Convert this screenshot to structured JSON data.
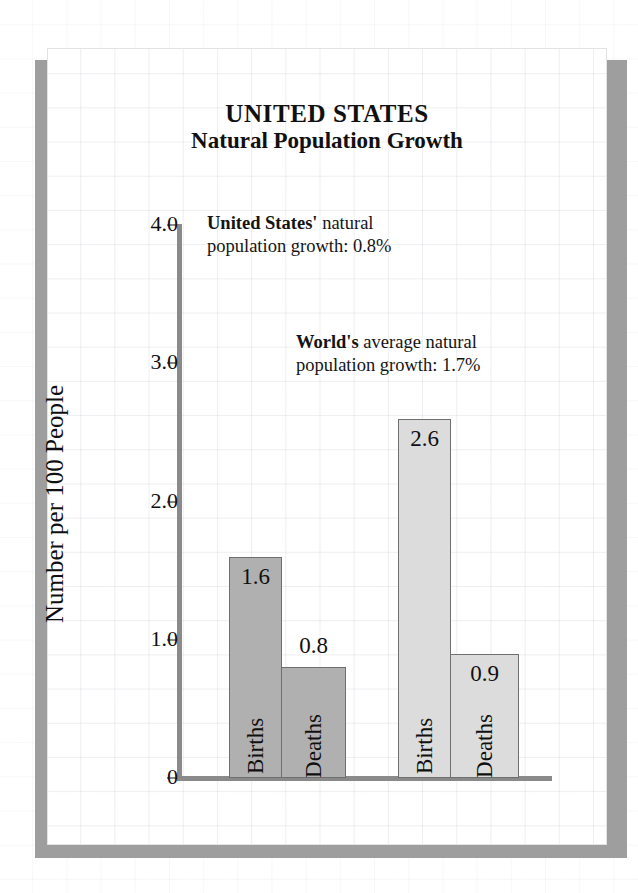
{
  "title": {
    "main": "UNITED STATES",
    "sub": "Natural Population Growth"
  },
  "annotations": {
    "us": {
      "lead": "United States'",
      "rest": " natural",
      "line2": "population growth:  0.8%"
    },
    "world": {
      "lead": "World's",
      "rest": " average natural",
      "line2": "population growth:  1.7%"
    }
  },
  "axis": {
    "y_title": "Number per 100 People",
    "y_ticks": [
      "4.0",
      "3.0",
      "2.0",
      "1.0",
      "0"
    ]
  },
  "chart_data": {
    "type": "bar",
    "title": "UNITED STATES Natural Population Growth",
    "xlabel": "",
    "ylabel": "Number per 100 People",
    "ylim": [
      0,
      4.0
    ],
    "yticks": [
      0,
      1.0,
      2.0,
      3.0,
      4.0
    ],
    "grid": true,
    "legend": "none",
    "groups": [
      {
        "name": "United States",
        "color": "#b0b0b0",
        "bars": [
          {
            "category": "Births",
            "value": 1.6,
            "label": "1.6",
            "label_position": "inside"
          },
          {
            "category": "Deaths",
            "value": 0.8,
            "label": "0.8",
            "label_position": "above"
          }
        ]
      },
      {
        "name": "World",
        "color": "#dcdcdc",
        "bars": [
          {
            "category": "Births",
            "value": 2.6,
            "label": "2.6",
            "label_position": "inside"
          },
          {
            "category": "Deaths",
            "value": 0.9,
            "label": "0.9",
            "label_position": "inside"
          }
        ]
      }
    ],
    "categories": [
      "Births",
      "Deaths",
      "Births",
      "Deaths"
    ],
    "values": [
      1.6,
      0.8,
      2.6,
      0.9
    ],
    "annotations": [
      "United States' natural population growth:  0.8%",
      "World's average natural population growth:  1.7%"
    ]
  }
}
